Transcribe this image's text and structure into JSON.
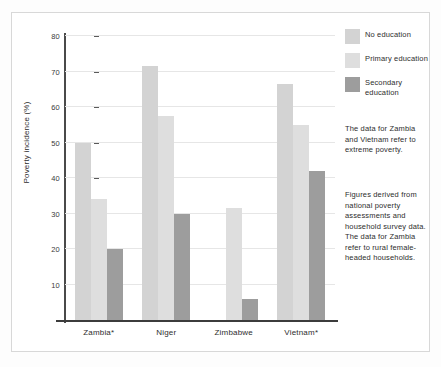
{
  "chart_data": {
    "type": "bar",
    "title": "",
    "xlabel": "",
    "ylabel": "Poverty incidence (%)",
    "ylim": [
      0,
      80
    ],
    "yticks": [
      80,
      70,
      60,
      50,
      40,
      30,
      20,
      10
    ],
    "grid": true,
    "legend_position": "right",
    "categories": [
      "Zambia*",
      "Niger",
      "Zimbabwe",
      "Vietnam*"
    ],
    "series": [
      {
        "name": "No education",
        "color": "#d3d3d3",
        "values": [
          50,
          71.5,
          null,
          66.5
        ]
      },
      {
        "name": "Primary education",
        "color": "#dedede",
        "values": [
          34,
          57.5,
          31.5,
          55
        ]
      },
      {
        "name": "Secondary education",
        "color": "#9d9d9d",
        "values": [
          20,
          30,
          6,
          42
        ]
      }
    ],
    "annotations": [
      "The data for Zambia and Vietnam refer to extreme poverty.",
      "Figures derived from national poverty assessments and household survey data. The data for Zambia refer to rural female-headed households."
    ]
  },
  "legend": {
    "items": [
      {
        "label": "No education"
      },
      {
        "label": "Primary education"
      },
      {
        "label": "Secondary education"
      }
    ]
  },
  "notes": {
    "note_1": "The data for Zambia and Vietnam refer to extreme poverty.",
    "note_2": "Figures derived from national poverty assessments and household survey data. The data for Zambia refer to rural female-headed households."
  }
}
